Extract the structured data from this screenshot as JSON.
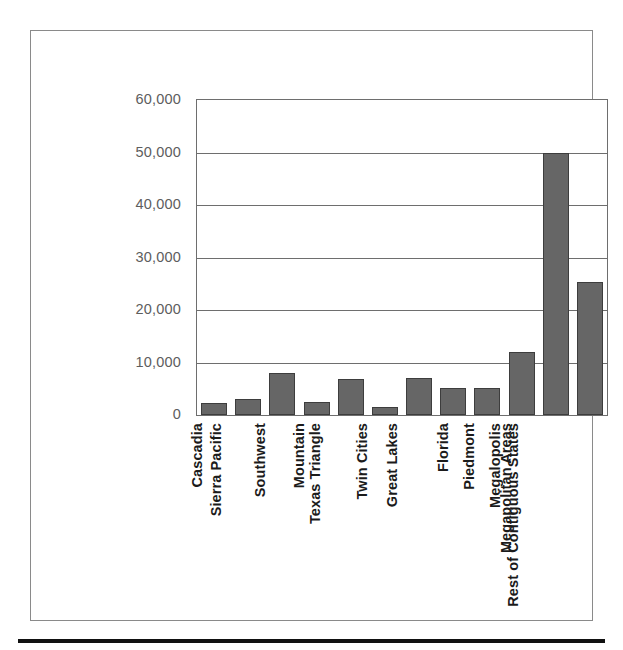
{
  "chart_data": {
    "type": "bar",
    "title": "",
    "xlabel": "",
    "ylabel": "",
    "ylim": [
      0,
      60000
    ],
    "grid": true,
    "legend": false,
    "bar_color": "#666666",
    "bar_edge_color": "#3d3d3d",
    "axis_color": "#6e6e6e",
    "tick_label_color": "#5d5d5d",
    "category_label_color": "#1b1b1b",
    "y_ticks": [
      0,
      10000,
      20000,
      30000,
      40000,
      50000,
      60000
    ],
    "y_tick_labels": [
      "0",
      "10,000",
      "20,000",
      "30,000",
      "40,000",
      "50,000",
      "60,000"
    ],
    "categories": [
      "Cascadia",
      "Sierra Pacific",
      "Southwest",
      "Mountain",
      "Texas Triangle",
      "Twin Cities",
      "Great Lakes",
      "Florida",
      "Piedmont",
      "Megalopolis",
      "Megapolitan Areas",
      "Rest of Contiguous States"
    ],
    "values": [
      2300,
      3100,
      8000,
      2500,
      6900,
      1500,
      7000,
      5200,
      5200,
      12000,
      50000,
      25400
    ]
  }
}
